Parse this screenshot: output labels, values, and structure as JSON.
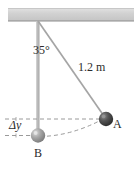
{
  "figure": {
    "type": "physics-diagram",
    "background_color": "#ffffff",
    "width": 134,
    "height": 174
  },
  "ceiling": {
    "name": "ceiling-support",
    "fill_color": "#d4d4d4",
    "edge_color": "#8a8a8a",
    "x": 8,
    "y": 8,
    "width": 126,
    "height": 13
  },
  "pivot": {
    "name": "pivot-point",
    "x": 38,
    "y": 21
  },
  "strings": {
    "vertical": {
      "name": "vertical-rod",
      "color": "#b0b0b0",
      "x1": 38,
      "y1": 21,
      "x2": 38,
      "y2": 135,
      "width": 3.2
    },
    "angled": {
      "name": "pendulum-string",
      "color": "#a8a8a8",
      "x1": 38,
      "y1": 21,
      "x2": 106,
      "y2": 119,
      "width": 1.6
    }
  },
  "angle": {
    "label": "35°",
    "value": 35,
    "unit": "degrees"
  },
  "length": {
    "label": "1.2 m",
    "value": 1.2,
    "unit": "m"
  },
  "height_drop": {
    "label": "Δy",
    "symbol": "delta-y"
  },
  "balls": [
    {
      "label": "A",
      "name": "ball-a",
      "cx": 106,
      "cy": 119,
      "r": 7,
      "fill": "#4a4a4a",
      "highlight": "#9a9a9a",
      "position": "raised"
    },
    {
      "label": "B",
      "name": "ball-b",
      "cx": 38,
      "cy": 135,
      "r": 7,
      "fill": "#9e9e9e",
      "highlight": "#d8d8d8",
      "position": "lowest"
    }
  ],
  "guides": {
    "dash_color": "#9a9a9a",
    "upper_line": {
      "name": "upper-level-line",
      "x1": 5,
      "y1": 119,
      "x2": 104,
      "y2": 119
    },
    "lower_line": {
      "name": "lower-level-line",
      "x1": 5,
      "y1": 135,
      "x2": 34,
      "y2": 135
    },
    "arc": {
      "name": "swing-arc",
      "from_x": 40,
      "from_y": 136,
      "to_x": 104,
      "to_y": 118
    }
  }
}
